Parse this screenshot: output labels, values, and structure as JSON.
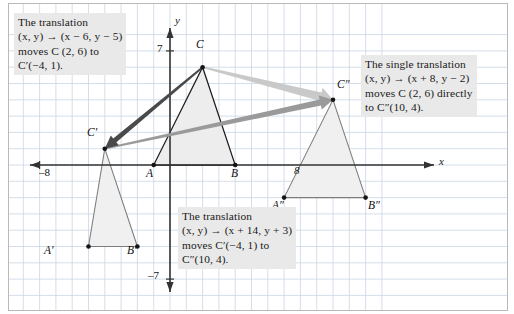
{
  "figure": {
    "type": "coordinate-geometry-diagram"
  },
  "axes": {
    "x_axis_label": "x",
    "y_axis_label": "y",
    "ticks": [
      {
        "name": "x-negative-eight",
        "text": "–8",
        "x": 39,
        "y": 172
      },
      {
        "name": "x-positive-eight",
        "text": "8",
        "x": 294,
        "y": 170
      },
      {
        "name": "y-positive-seven",
        "text": "7",
        "x": 157,
        "y": 46
      },
      {
        "name": "y-negative-seven",
        "text": "–7",
        "x": 150,
        "y": 272
      }
    ],
    "origin_px": {
      "x": 170,
      "y": 165
    },
    "unit_px": 16.3,
    "x_range": [
      -9,
      13
    ],
    "y_range": [
      -8,
      8
    ],
    "grid": true,
    "grid_color": "#c9d6e4"
  },
  "callouts": [
    {
      "name": "callout-first-translation",
      "lines": [
        "The translation",
        "(x, y) → (x − 6, y − 5)",
        "moves C (2, 6) to",
        "C′(−4, 1)."
      ],
      "x": 14,
      "y": 14,
      "width": 140
    },
    {
      "name": "callout-single-translation",
      "lines": [
        "The single translation",
        "(x, y) → (x + 8, y − 2)",
        "moves C (2, 6) directly",
        "to C″(10, 4)."
      ],
      "x": 361,
      "y": 56,
      "width": 145
    },
    {
      "name": "callout-second-translation",
      "lines": [
        "The translation",
        "(x, y) → (x + 14, y + 3)",
        "moves C′(−4, 1) to",
        "C″(10, 4)."
      ],
      "x": 178,
      "y": 208,
      "width": 140
    }
  ],
  "triangles": [
    {
      "name": "triangle-abc",
      "style": "preimage",
      "stroke": "#1d1d1d",
      "fill": "#ededed",
      "vertices": [
        {
          "label": "A",
          "x": -1,
          "y": 0
        },
        {
          "label": "B",
          "x": 4,
          "y": 0
        },
        {
          "label": "C",
          "x": 2,
          "y": 6
        }
      ]
    },
    {
      "name": "triangle-a-prime-b-prime-c-prime",
      "style": "image-1",
      "stroke": "#7c7c7c",
      "fill": "#f0f0f0",
      "vertices": [
        {
          "label": "A′",
          "x": -5,
          "y": -5
        },
        {
          "label": "B′",
          "x": -2,
          "y": -5
        },
        {
          "label": "C′",
          "x": -4,
          "y": 1
        }
      ]
    },
    {
      "name": "triangle-a-double-prime-b-double-prime-c-double-prime",
      "style": "image-2",
      "stroke": "#7c7c7c",
      "fill": "#f0f0f0",
      "vertices": [
        {
          "label": "A″",
          "x": 7,
          "y": -2
        },
        {
          "label": "B″",
          "x": 12,
          "y": -2
        },
        {
          "label": "C″",
          "x": 10,
          "y": 4
        }
      ]
    }
  ],
  "vertex_labels": [
    {
      "name": "vertex-label-C",
      "text": "C",
      "x": 196,
      "y": 40
    },
    {
      "name": "vertex-label-A",
      "text": "A",
      "x": 146,
      "y": 169
    },
    {
      "name": "vertex-label-B",
      "text": "B",
      "x": 231,
      "y": 169
    },
    {
      "name": "vertex-label-C-prime",
      "text": "C′",
      "x": 88,
      "y": 127
    },
    {
      "name": "vertex-label-A-prime",
      "text": "A′",
      "x": 44,
      "y": 246
    },
    {
      "name": "vertex-label-B-prime",
      "text": "B′",
      "x": 128,
      "y": 246
    },
    {
      "name": "vertex-label-C-double-prime",
      "text": "C″",
      "x": 337,
      "y": 80
    },
    {
      "name": "vertex-label-A-double-prime",
      "text": "A″",
      "x": 272,
      "y": 201
    },
    {
      "name": "vertex-label-B-double-prime",
      "text": "B″",
      "x": 368,
      "y": 201
    }
  ],
  "arrows": [
    {
      "name": "arrow-C-to-C-double-prime",
      "description": "single translation vector from C to C double prime",
      "color": "#c9c9c9",
      "from": {
        "x": 2,
        "y": 6
      },
      "to": {
        "x": 10,
        "y": 4
      },
      "width": 7
    },
    {
      "name": "arrow-C-prime-to-C-double-prime",
      "description": "second translation vector from C prime to C double prime",
      "color": "#9a9a9a",
      "from": {
        "x": -4,
        "y": 1
      },
      "to": {
        "x": 10,
        "y": 4
      },
      "width": 5
    },
    {
      "name": "arrow-C-to-C-prime",
      "description": "first translation vector from C to C prime",
      "color": "#4a4a4a",
      "from": {
        "x": 2,
        "y": 6
      },
      "to": {
        "x": -4,
        "y": 1
      },
      "width": 4
    }
  ],
  "chart_data": {
    "type": "scatter",
    "xlabel": "x",
    "ylabel": "y",
    "xlim": [
      -9,
      13
    ],
    "ylim": [
      -8,
      8
    ],
    "grid": true,
    "series": [
      {
        "name": "Triangle ABC (preimage)",
        "points": [
          [
            -1,
            0
          ],
          [
            4,
            0
          ],
          [
            2,
            6
          ]
        ],
        "labels": [
          "A",
          "B",
          "C"
        ]
      },
      {
        "name": "Triangle A'B'C' (after (x−6, y−5))",
        "points": [
          [
            -5,
            -5
          ],
          [
            -2,
            -5
          ],
          [
            -4,
            1
          ]
        ],
        "labels": [
          "A′",
          "B′",
          "C′"
        ]
      },
      {
        "name": "Triangle A″B″C″ (after (x+14, y+3))",
        "points": [
          [
            7,
            -2
          ],
          [
            12,
            -2
          ],
          [
            10,
            4
          ]
        ],
        "labels": [
          "A″",
          "B″",
          "C″"
        ]
      }
    ],
    "annotations": [
      "The translation (x, y) → (x − 6, y − 5) moves C (2, 6) to C′(−4, 1).",
      "The translation (x, y) → (x + 14, y + 3) moves C′(−4, 1) to C″(10, 4).",
      "The single translation (x, y) → (x + 8, y − 2) moves C (2, 6) directly to C″(10, 4)."
    ]
  }
}
